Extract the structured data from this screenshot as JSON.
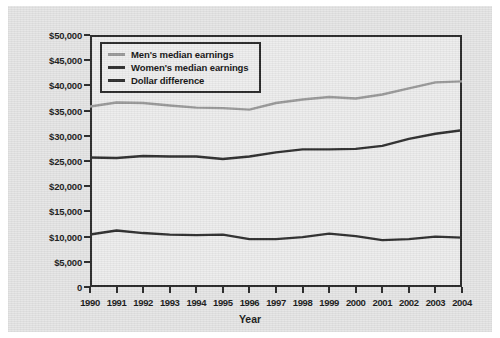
{
  "chart_data": {
    "type": "line",
    "title": "",
    "xlabel": "Year",
    "ylabel": "",
    "grid": false,
    "legend_position": "top-left",
    "x": [
      1990,
      1991,
      1992,
      1993,
      1994,
      1995,
      1996,
      1997,
      1998,
      1999,
      2000,
      2001,
      2002,
      2003,
      2004
    ],
    "categories": [
      "1990",
      "1991",
      "1992",
      "1993",
      "1994",
      "1995",
      "1996",
      "1997",
      "1998",
      "1999",
      "2000",
      "2001",
      "2002",
      "2003",
      "2004"
    ],
    "ylim": [
      0,
      50000
    ],
    "xlim": [
      1990,
      2004
    ],
    "ytick_labels": [
      "$50,000",
      "$45,000",
      "$40,000",
      "$35,000",
      "$30,000",
      "$25,000",
      "$20,000",
      "$15,000",
      "$10,000",
      "$5,000",
      "0"
    ],
    "ytick_values": [
      50000,
      45000,
      40000,
      35000,
      30000,
      25000,
      20000,
      15000,
      10000,
      5000,
      0
    ],
    "series": [
      {
        "name": "Men's median earnings",
        "color": "#9a9a9a",
        "values": [
          35800,
          36600,
          36500,
          36000,
          35600,
          35500,
          35200,
          36500,
          37200,
          37700,
          37400,
          38200,
          39400,
          40600,
          40800
        ]
      },
      {
        "name": "Women's median earnings",
        "color": "#2f2f2f",
        "values": [
          25700,
          25600,
          26000,
          25900,
          25900,
          25400,
          25900,
          26700,
          27300,
          27300,
          27400,
          28000,
          29400,
          30400,
          31100
        ]
      },
      {
        "name": "Dollar difference",
        "color": "#2f2f2f",
        "values": [
          10400,
          11200,
          10700,
          10400,
          10300,
          10400,
          9500,
          9500,
          9900,
          10600,
          10100,
          9300,
          9500,
          10000,
          9800
        ]
      }
    ]
  },
  "axis": {
    "x_title": "Year"
  },
  "legend": {
    "items": [
      {
        "label": "Men's median earnings"
      },
      {
        "label": "Women's median earnings"
      },
      {
        "label": "Dollar difference"
      }
    ]
  }
}
